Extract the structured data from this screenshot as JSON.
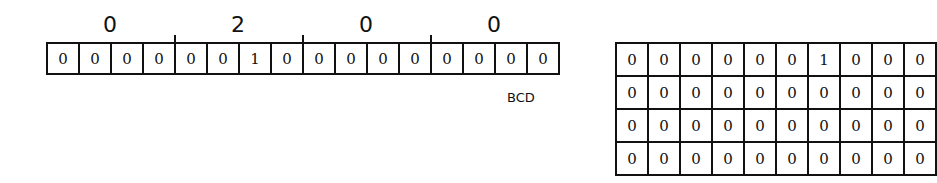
{
  "bcd_strip": {
    "digits": [
      "0",
      "2",
      "0",
      "0"
    ],
    "bits": [
      "0",
      "0",
      "0",
      "0",
      "0",
      "0",
      "1",
      "0",
      "0",
      "0",
      "0",
      "0",
      "0",
      "0",
      "0",
      "0"
    ],
    "label": "BCD"
  },
  "grid": {
    "rows": [
      [
        "0",
        "0",
        "0",
        "0",
        "0",
        "0",
        "1",
        "0",
        "0",
        "0"
      ],
      [
        "0",
        "0",
        "0",
        "0",
        "0",
        "0",
        "0",
        "0",
        "0",
        "0"
      ],
      [
        "0",
        "0",
        "0",
        "0",
        "0",
        "0",
        "0",
        "0",
        "0",
        "0"
      ],
      [
        "0",
        "0",
        "0",
        "0",
        "0",
        "0",
        "0",
        "0",
        "0",
        "0"
      ]
    ]
  }
}
